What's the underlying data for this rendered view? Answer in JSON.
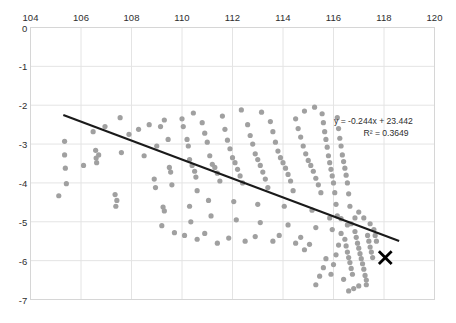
{
  "chart_data": {
    "type": "scatter",
    "title": "",
    "xlabel": "",
    "ylabel": "",
    "xlim": [
      104,
      120
    ],
    "ylim": [
      -7,
      0
    ],
    "xticks": [
      104,
      106,
      108,
      110,
      112,
      114,
      116,
      118,
      120
    ],
    "yticks": [
      0,
      -1,
      -2,
      -3,
      -4,
      -5,
      -6,
      -7
    ],
    "grid": true,
    "legend": false,
    "x_axis_position": "top",
    "point_color": "#a0a0a0",
    "trendline_color": "#1a1a1a",
    "marker_color": "#000000",
    "gridline_color": "#e4e4e4",
    "annotations": {
      "equation": "y = -0.244x + 23.442",
      "r_squared": "R² = 0.3649"
    },
    "trendline": {
      "slope": -0.244,
      "intercept": 23.442,
      "x_start": 105.3,
      "x_end": 118.6
    },
    "highlight_point": {
      "label": "X",
      "x": 118.05,
      "y": -5.92
    },
    "series": [
      {
        "name": "observations",
        "points": [
          [
            105.35,
            -2.93
          ],
          [
            105.35,
            -3.28
          ],
          [
            105.38,
            -3.62
          ],
          [
            105.42,
            -4.02
          ],
          [
            105.12,
            -4.33
          ],
          [
            106.48,
            -2.68
          ],
          [
            106.58,
            -3.16
          ],
          [
            106.6,
            -3.36
          ],
          [
            106.62,
            -3.48
          ],
          [
            106.7,
            -3.28
          ],
          [
            107.55,
            -2.32
          ],
          [
            107.6,
            -3.22
          ],
          [
            107.35,
            -4.3
          ],
          [
            107.42,
            -4.45
          ],
          [
            107.38,
            -4.6
          ],
          [
            108.28,
            -2.62
          ],
          [
            108.5,
            -3.3
          ],
          [
            108.9,
            -3.9
          ],
          [
            108.95,
            -4.12
          ],
          [
            109.0,
            -3.05
          ],
          [
            109.15,
            -2.55
          ],
          [
            109.3,
            -2.38
          ],
          [
            109.45,
            -2.88
          ],
          [
            109.5,
            -3.6
          ],
          [
            109.55,
            -3.72
          ],
          [
            109.6,
            -4.05
          ],
          [
            109.25,
            -4.62
          ],
          [
            109.3,
            -4.72
          ],
          [
            110.0,
            -2.35
          ],
          [
            110.05,
            -2.55
          ],
          [
            110.2,
            -2.88
          ],
          [
            110.25,
            -3.05
          ],
          [
            110.3,
            -3.4
          ],
          [
            110.4,
            -3.55
          ],
          [
            110.5,
            -3.7
          ],
          [
            110.55,
            -3.85
          ],
          [
            110.6,
            -4.2
          ],
          [
            110.3,
            -4.6
          ],
          [
            110.35,
            -5.0
          ],
          [
            110.8,
            -2.45
          ],
          [
            110.9,
            -2.72
          ],
          [
            111.0,
            -2.95
          ],
          [
            111.1,
            -3.3
          ],
          [
            111.2,
            -3.52
          ],
          [
            111.3,
            -3.6
          ],
          [
            111.4,
            -3.75
          ],
          [
            111.5,
            -3.95
          ],
          [
            111.05,
            -4.45
          ],
          [
            111.15,
            -4.85
          ],
          [
            111.6,
            -2.28
          ],
          [
            111.7,
            -2.62
          ],
          [
            111.8,
            -2.9
          ],
          [
            111.9,
            -3.12
          ],
          [
            112.0,
            -3.35
          ],
          [
            112.1,
            -3.48
          ],
          [
            112.2,
            -3.65
          ],
          [
            112.3,
            -3.82
          ],
          [
            112.4,
            -4.0
          ],
          [
            112.05,
            -4.48
          ],
          [
            112.15,
            -4.95
          ],
          [
            112.6,
            -2.5
          ],
          [
            112.7,
            -2.78
          ],
          [
            112.8,
            -3.0
          ],
          [
            112.9,
            -3.25
          ],
          [
            113.0,
            -3.4
          ],
          [
            113.1,
            -3.55
          ],
          [
            113.2,
            -3.72
          ],
          [
            113.3,
            -3.9
          ],
          [
            113.4,
            -4.12
          ],
          [
            113.0,
            -4.55
          ],
          [
            113.1,
            -5.02
          ],
          [
            113.5,
            -2.42
          ],
          [
            113.6,
            -2.68
          ],
          [
            113.7,
            -2.95
          ],
          [
            113.8,
            -3.18
          ],
          [
            113.9,
            -3.35
          ],
          [
            114.0,
            -3.48
          ],
          [
            114.1,
            -3.62
          ],
          [
            114.2,
            -3.78
          ],
          [
            114.3,
            -3.95
          ],
          [
            114.4,
            -4.2
          ],
          [
            114.05,
            -4.6
          ],
          [
            114.2,
            -5.08
          ],
          [
            114.5,
            -2.35
          ],
          [
            114.6,
            -2.6
          ],
          [
            114.7,
            -2.82
          ],
          [
            114.8,
            -3.05
          ],
          [
            114.9,
            -3.25
          ],
          [
            115.0,
            -3.42
          ],
          [
            115.1,
            -3.55
          ],
          [
            115.2,
            -3.7
          ],
          [
            115.3,
            -3.88
          ],
          [
            115.4,
            -4.05
          ],
          [
            115.5,
            -4.25
          ],
          [
            115.15,
            -4.7
          ],
          [
            115.3,
            -5.15
          ],
          [
            115.55,
            -2.22
          ],
          [
            115.6,
            -2.45
          ],
          [
            115.65,
            -2.68
          ],
          [
            115.7,
            -2.88
          ],
          [
            115.75,
            -3.08
          ],
          [
            115.8,
            -3.3
          ],
          [
            115.85,
            -3.48
          ],
          [
            115.9,
            -3.65
          ],
          [
            115.95,
            -3.82
          ],
          [
            116.0,
            -4.0
          ],
          [
            116.05,
            -4.25
          ],
          [
            116.1,
            -4.55
          ],
          [
            115.95,
            -5.2
          ],
          [
            116.15,
            -2.32
          ],
          [
            116.2,
            -2.6
          ],
          [
            116.25,
            -2.85
          ],
          [
            116.3,
            -3.05
          ],
          [
            116.35,
            -3.28
          ],
          [
            116.4,
            -3.45
          ],
          [
            116.45,
            -3.62
          ],
          [
            116.5,
            -3.8
          ],
          [
            116.55,
            -4.0
          ],
          [
            116.6,
            -4.28
          ],
          [
            116.65,
            -4.6
          ],
          [
            116.3,
            -5.3
          ],
          [
            116.45,
            -5.45
          ],
          [
            116.5,
            -5.62
          ],
          [
            116.55,
            -5.78
          ],
          [
            116.6,
            -5.92
          ],
          [
            116.65,
            -6.05
          ],
          [
            116.7,
            -6.2
          ],
          [
            116.75,
            -6.35
          ],
          [
            116.4,
            -6.48
          ],
          [
            116.2,
            -5.6
          ],
          [
            116.1,
            -5.85
          ],
          [
            116.0,
            -6.1
          ],
          [
            115.9,
            -6.35
          ],
          [
            116.85,
            -5.25
          ],
          [
            116.9,
            -5.4
          ],
          [
            116.95,
            -5.55
          ],
          [
            117.0,
            -5.68
          ],
          [
            117.05,
            -5.82
          ],
          [
            117.1,
            -5.95
          ],
          [
            117.15,
            -6.08
          ],
          [
            117.2,
            -6.22
          ],
          [
            117.25,
            -6.38
          ],
          [
            117.3,
            -6.5
          ],
          [
            117.35,
            -5.35
          ],
          [
            117.4,
            -5.5
          ],
          [
            117.45,
            -5.65
          ],
          [
            117.5,
            -5.78
          ],
          [
            117.55,
            -5.92
          ],
          [
            117.3,
            -6.62
          ],
          [
            117.0,
            -6.65
          ],
          [
            116.8,
            -6.72
          ],
          [
            116.6,
            -6.78
          ],
          [
            115.7,
            -5.95
          ],
          [
            115.6,
            -6.18
          ],
          [
            115.45,
            -6.4
          ],
          [
            115.3,
            -6.62
          ],
          [
            117.6,
            -5.2
          ],
          [
            117.65,
            -5.35
          ],
          [
            117.7,
            -5.5
          ],
          [
            117.45,
            -5.05
          ],
          [
            117.2,
            -4.9
          ],
          [
            117.0,
            -4.75
          ],
          [
            116.85,
            -4.9
          ],
          [
            116.7,
            -5.05
          ],
          [
            116.55,
            -5.08
          ],
          [
            116.3,
            -4.92
          ],
          [
            116.15,
            -4.85
          ],
          [
            115.85,
            -4.9
          ],
          [
            115.05,
            -5.58
          ],
          [
            114.85,
            -5.72
          ],
          [
            114.7,
            -5.4
          ],
          [
            114.5,
            -5.55
          ],
          [
            113.85,
            -5.35
          ],
          [
            113.6,
            -5.5
          ],
          [
            112.9,
            -5.38
          ],
          [
            112.5,
            -5.5
          ],
          [
            111.85,
            -5.42
          ],
          [
            111.4,
            -5.55
          ],
          [
            110.9,
            -5.3
          ],
          [
            110.6,
            -5.45
          ],
          [
            110.1,
            -5.35
          ],
          [
            109.7,
            -5.28
          ],
          [
            109.2,
            -5.1
          ],
          [
            112.35,
            -2.12
          ],
          [
            113.15,
            -2.18
          ],
          [
            114.85,
            -2.15
          ],
          [
            115.25,
            -2.05
          ],
          [
            110.45,
            -2.2
          ],
          [
            108.7,
            -2.5
          ],
          [
            107.9,
            -2.75
          ],
          [
            106.95,
            -2.55
          ],
          [
            106.1,
            -3.55
          ]
        ]
      }
    ]
  }
}
